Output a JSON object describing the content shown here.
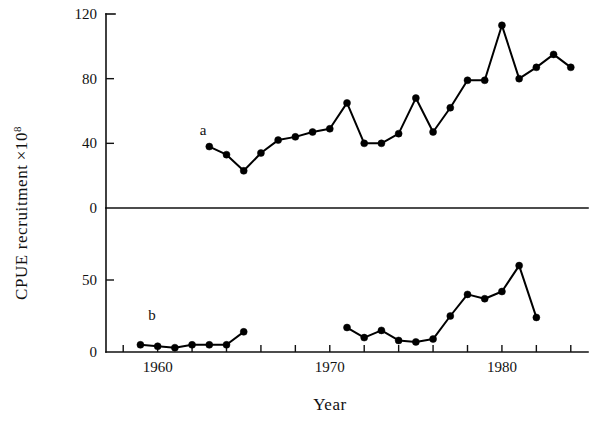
{
  "figure": {
    "ylabel": "CPUE recruitment ×10⁸",
    "ylabel_main": "CPUE recruitment",
    "ylabel_multiplier_base": "×10",
    "ylabel_multiplier_exp": "8",
    "xlabel": "Year",
    "panel_a_label": "a",
    "panel_b_label": "b"
  },
  "axes": {
    "x_tick_labels": [
      "1960",
      "1970",
      "1980"
    ],
    "x_tick_label_values": [
      1960,
      1970,
      1980
    ],
    "x_minor_tick_values": [
      1958,
      1960,
      1962,
      1964,
      1966,
      1968,
      1970,
      1972,
      1974,
      1976,
      1978,
      1980,
      1982,
      1984
    ],
    "x_range": [
      1957,
      1985
    ],
    "top_y_tick_labels": [
      "0",
      "40",
      "80",
      "120"
    ],
    "top_y_tick_values": [
      0,
      40,
      80,
      120
    ],
    "top_y_range": [
      0,
      120
    ],
    "bottom_y_tick_labels": [
      "0",
      "50"
    ],
    "bottom_y_tick_values": [
      0,
      50
    ],
    "bottom_y_range": [
      0,
      100
    ],
    "grid": false,
    "legend_position": "inline-panel-letters"
  },
  "chart_data": [
    {
      "type": "line",
      "name": "a",
      "panel": "top",
      "title": "CPUE recruitment ×10⁸ (panel a)",
      "xlabel": "Year",
      "ylabel": "CPUE recruitment ×10⁸",
      "ylim": [
        0,
        120
      ],
      "xlim": [
        1957,
        1985
      ],
      "grid": false,
      "marker": "filled-circle",
      "x": [
        1963,
        1964,
        1965,
        1966,
        1967,
        1968,
        1969,
        1970,
        1971,
        1972,
        1973,
        1974,
        1975,
        1976,
        1977,
        1978,
        1979,
        1980,
        1981,
        1982,
        1983,
        1984
      ],
      "values": [
        38,
        33,
        23,
        34,
        42,
        44,
        47,
        49,
        65,
        40,
        40,
        46,
        68,
        47,
        62,
        79,
        79,
        113,
        80,
        87,
        95,
        87
      ]
    },
    {
      "type": "line",
      "name": "b",
      "panel": "bottom",
      "title": "CPUE recruitment ×10⁸ (panel b)",
      "xlabel": "Year",
      "ylabel": "CPUE recruitment ×10⁸",
      "ylim": [
        0,
        100
      ],
      "xlim": [
        1957,
        1985
      ],
      "grid": false,
      "marker": "filled-circle",
      "segments": [
        {
          "x": [
            1959,
            1960,
            1961,
            1962,
            1963,
            1964,
            1965
          ],
          "values": [
            5,
            4,
            3,
            5,
            5,
            5,
            14
          ]
        },
        {
          "x": [
            1971,
            1972,
            1973,
            1974,
            1975,
            1976,
            1977,
            1978,
            1979,
            1980,
            1981,
            1982
          ],
          "values": [
            17,
            10,
            15,
            8,
            7,
            9,
            25,
            40,
            37,
            42,
            60,
            24
          ]
        }
      ]
    }
  ]
}
